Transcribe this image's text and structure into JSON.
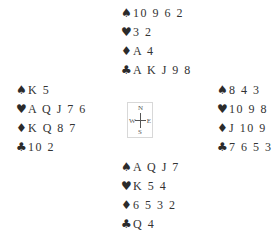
{
  "suits": {
    "spades": "♠",
    "hearts": "♥",
    "diamonds": "♦",
    "clubs": "♣"
  },
  "hands": {
    "north": {
      "spades": "10 9 6 2",
      "hearts": "3 2",
      "diamonds": "A 4",
      "clubs": "A K J 9 8"
    },
    "west": {
      "spades": "K 5",
      "hearts": "A Q J 7 6",
      "diamonds": "K Q 8 7",
      "clubs": "10 2"
    },
    "east": {
      "spades": "8 4 3",
      "hearts": "10 9 8",
      "diamonds": "J 10 9",
      "clubs": "7 6 5 3"
    },
    "south": {
      "spades": "A Q J 7",
      "hearts": "K 5 4",
      "diamonds": "6 5 3 2",
      "clubs": "Q 4"
    }
  },
  "compass": {
    "n": "N",
    "s": "S",
    "w": "W",
    "e": "E"
  }
}
